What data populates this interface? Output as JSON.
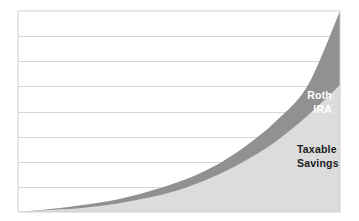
{
  "chart_data": {
    "type": "area",
    "title": "",
    "subtitle": "",
    "xlabel": "",
    "ylabel": "",
    "xlim": [
      0,
      100
    ],
    "ylim": [
      0,
      100
    ],
    "grid": true,
    "grid_lines_y": [
      12.5,
      25,
      37.5,
      50,
      62.5,
      75,
      87.5
    ],
    "x_tick_labels": [],
    "y_tick_labels": [],
    "legend_position": "inline-annotation",
    "stacked": true,
    "x": [
      0,
      10,
      20,
      30,
      40,
      50,
      60,
      70,
      80,
      90,
      100
    ],
    "series": [
      {
        "name": "Taxable Savings",
        "color": "#dcdcdc",
        "label_color": "#1c1c1c",
        "values": [
          0,
          1,
          2,
          4,
          7,
          11,
          17,
          25,
          35,
          48,
          63
        ]
      },
      {
        "name": "Roth IRA",
        "color": "#919191",
        "label_color": "#ffffff",
        "values": [
          0,
          1.5,
          3.5,
          6,
          10,
          15,
          22,
          32,
          45,
          63,
          100
        ]
      }
    ],
    "annotations": [
      {
        "id": "roth-ira-label",
        "lines": [
          "Roth",
          "IRA"
        ],
        "series": "Roth IRA",
        "x_px": 332,
        "y_px": 99,
        "anchor": "end",
        "color": "#ffffff"
      },
      {
        "id": "taxable-savings-label",
        "lines": [
          "Taxable",
          "Savings"
        ],
        "series": "Taxable Savings",
        "x_px": 297,
        "y_px": 153,
        "anchor": "start",
        "color": "#1c1c1c"
      }
    ]
  },
  "plot": {
    "background_color": "#ffffff",
    "border_color": "#cfcfcf",
    "grid_color": "#d8d8d8",
    "left_px": 18,
    "top_px": 11,
    "right_px": 340,
    "bottom_px": 212
  },
  "labels": {
    "roth_line1": "Roth",
    "roth_line2": "IRA",
    "taxable_line1": "Taxable",
    "taxable_line2": "Savings"
  }
}
